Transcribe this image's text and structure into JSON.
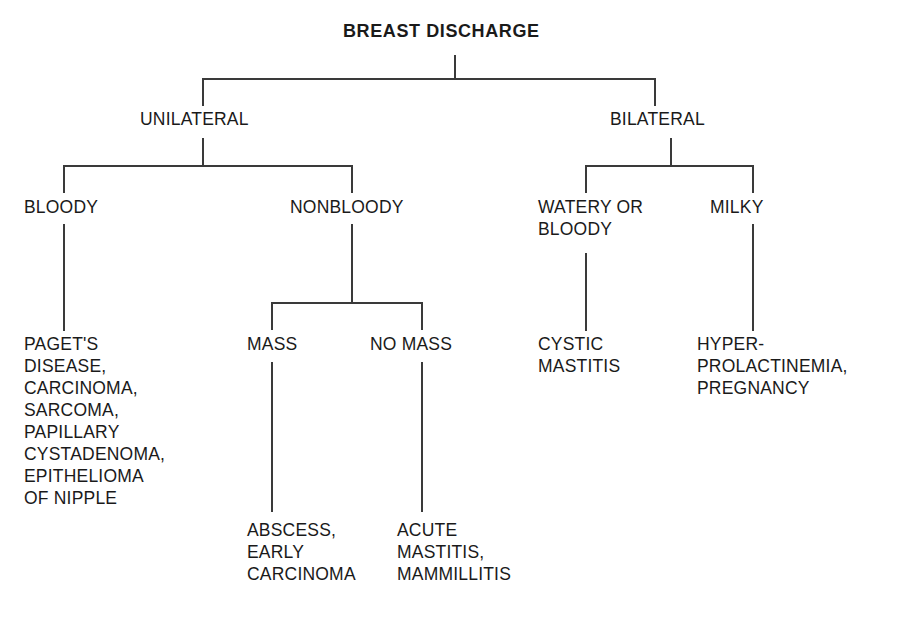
{
  "diagram": {
    "title": "BREAST DISCHARGE",
    "type": "flowchart",
    "orientation": "top-down",
    "line_color": "#3a3a3a",
    "text_color": "#1a1a1a",
    "background": "#ffffff",
    "nodes": {
      "root": "BREAST DISCHARGE",
      "unilateral": "UNILATERAL",
      "bilateral": "BILATERAL",
      "bloody": "BLOODY",
      "nonbloody": "NONBLOODY",
      "watery_or_bloody": "WATERY OR\nBLOODY",
      "milky": "MILKY",
      "mass": "MASS",
      "no_mass": "NO MASS",
      "bloody_outcomes": "PAGET'S\nDISEASE,\nCARCINOMA,\nSARCOMA,\nPAPILLARY\nCYSTADENOMA,\nEPITHELIOMA\nOF NIPPLE",
      "mass_outcomes": "ABSCESS,\nEARLY\nCARCINOMA",
      "no_mass_outcomes": "ACUTE\nMASTITIS,\nMAMMILLITIS",
      "watery_outcomes": "CYSTIC\nMASTITIS",
      "milky_outcomes": "HYPER-\nPROLACTINEMIA,\nPREGNANCY"
    }
  }
}
